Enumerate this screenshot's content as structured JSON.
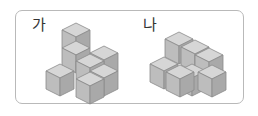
{
  "frame": {
    "border_color": "#b9b9b9"
  },
  "colors": {
    "top": "#d6d6d6",
    "left": "#bdbdbd",
    "right": "#a9a9a9",
    "edge": "#8a8a8a"
  },
  "shapes": [
    {
      "label": "가",
      "label_pos": [
        32,
        18
      ],
      "cubes": [
        {
          "x": 62,
          "y": 23
        },
        {
          "x": 62,
          "y": 41
        },
        {
          "x": 90,
          "y": 46
        },
        {
          "x": 76,
          "y": 54
        },
        {
          "x": 90,
          "y": 64
        },
        {
          "x": 76,
          "y": 72
        },
        {
          "x": 46,
          "y": 64
        }
      ]
    },
    {
      "label": "나",
      "label_pos": [
        143,
        18
      ],
      "cubes": [
        {
          "x": 178,
          "y": 64
        },
        {
          "x": 165,
          "y": 32
        },
        {
          "x": 181,
          "y": 40
        },
        {
          "x": 195,
          "y": 48
        },
        {
          "x": 150,
          "y": 57
        },
        {
          "x": 166,
          "y": 65
        },
        {
          "x": 198,
          "y": 65
        }
      ]
    }
  ]
}
